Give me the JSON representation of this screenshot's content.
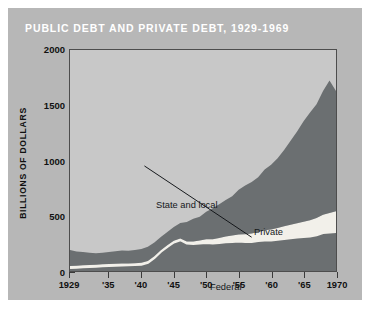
{
  "figure": {
    "title": "PUBLIC DEBT AND PRIVATE DEBT, 1929-1969",
    "colors": {
      "card_background": "#b7b7b7",
      "plot_background": "#c8c8c8",
      "private_fill": "#6b6f71",
      "federal_fill": "#6b6f71",
      "state_local_fill": "#f2f0ea",
      "title_text": "#ffffff",
      "axis": "#3a3a3a"
    }
  },
  "axes": {
    "y_title": "BILLIONS OF DOLLARS",
    "y_ticks": [
      "0",
      "500",
      "1000",
      "1500",
      "2000"
    ],
    "x_ticks": [
      "1929",
      "'35",
      "'40",
      "'45",
      "'50",
      "'55",
      "'60",
      "'65",
      "1970"
    ]
  },
  "annotations": {
    "state_and_local": "State and local",
    "private": "Private",
    "federal": "Federal"
  },
  "chart_data": {
    "type": "area",
    "title": "PUBLIC DEBT AND PRIVATE DEBT, 1929-1969",
    "subtitle": "",
    "xlabel": "",
    "ylabel": "BILLIONS OF DOLLARS",
    "stacked": true,
    "grid": false,
    "legend_position": "in-plot labels",
    "xlim": [
      1929,
      1970
    ],
    "ylim": [
      0,
      2000
    ],
    "y_ticks": [
      0,
      500,
      1000,
      1500,
      2000
    ],
    "x_tick_values": [
      1929,
      1935,
      1940,
      1945,
      1950,
      1955,
      1960,
      1965,
      1970
    ],
    "x_tick_labels": [
      "1929",
      "'35",
      "'40",
      "'45",
      "'50",
      "'55",
      "'60",
      "'65",
      "1970"
    ],
    "x": [
      1929,
      1930,
      1931,
      1932,
      1933,
      1934,
      1935,
      1936,
      1937,
      1938,
      1939,
      1940,
      1941,
      1942,
      1943,
      1944,
      1945,
      1946,
      1947,
      1948,
      1949,
      1950,
      1951,
      1952,
      1953,
      1954,
      1955,
      1956,
      1957,
      1958,
      1959,
      1960,
      1961,
      1962,
      1963,
      1964,
      1965,
      1966,
      1967,
      1968,
      1969,
      1970
    ],
    "series": [
      {
        "name": "Federal",
        "stack_order": 1,
        "values": [
          30,
          32,
          35,
          38,
          40,
          45,
          48,
          50,
          52,
          53,
          55,
          58,
          75,
          120,
          175,
          220,
          260,
          280,
          250,
          245,
          250,
          255,
          250,
          255,
          262,
          265,
          268,
          265,
          265,
          272,
          278,
          278,
          285,
          292,
          298,
          305,
          310,
          315,
          325,
          345,
          350,
          355
        ],
        "peak": {
          "year": 1946,
          "value": 280
        },
        "notes": "White-outlined lower band; sharp WWII rise peaking 1946 then dropping"
      },
      {
        "name": "State and local",
        "stack_order": 2,
        "values": [
          15,
          15,
          16,
          16,
          16,
          16,
          16,
          16,
          16,
          16,
          16,
          16,
          15,
          14,
          13,
          13,
          14,
          15,
          18,
          22,
          27,
          32,
          38,
          44,
          50,
          56,
          62,
          68,
          75,
          82,
          90,
          98,
          105,
          112,
          120,
          128,
          136,
          145,
          155,
          165,
          175,
          185
        ],
        "notes": "Thin pale band between Federal and Private; widens after 1950"
      },
      {
        "name": "Private",
        "stack_order": 3,
        "values": [
          145,
          130,
          120,
          110,
          105,
          105,
          108,
          112,
          118,
          115,
          118,
          125,
          130,
          125,
          120,
          120,
          125,
          140,
          175,
          205,
          215,
          250,
          280,
          305,
          330,
          355,
          405,
          440,
          465,
          495,
          550,
          585,
          630,
          690,
          760,
          830,
          910,
          975,
          1030,
          1120,
          1200,
          1090
        ],
        "notes": "Dark gray top band; accelerating growth after 1950"
      }
    ],
    "totals": [
      190,
      177,
      171,
      164,
      161,
      166,
      172,
      178,
      186,
      184,
      189,
      199,
      220,
      259,
      308,
      353,
      399,
      435,
      443,
      472,
      492,
      537,
      568,
      604,
      642,
      676,
      735,
      773,
      805,
      849,
      918,
      961,
      1020,
      1094,
      1178,
      1263,
      1356,
      1435,
      1510,
      1630,
      1725,
      1630
    ],
    "annotations": [
      {
        "text": "State and local",
        "points_to_year": 1957,
        "leader_line": true
      },
      {
        "text": "Private",
        "points_to_year": 1959,
        "leader_line": false
      },
      {
        "text": "Federal",
        "points_to_year": 1952,
        "leader_line": false
      }
    ]
  }
}
